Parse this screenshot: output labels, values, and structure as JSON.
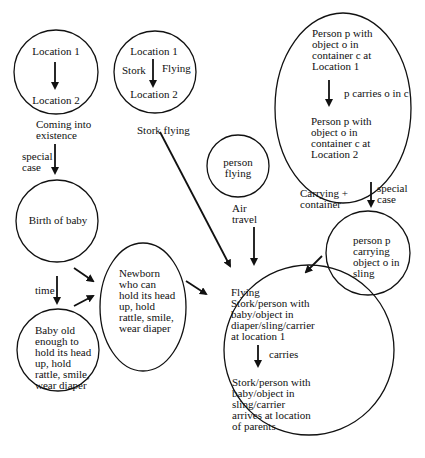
{
  "diagram": {
    "nodes": {
      "coming_into_existence": {
        "top": "Location 1",
        "bottom": "Location 2",
        "caption": "Coming into\nexistence"
      },
      "stork_flying": {
        "top": "Location 1",
        "left": "Stork",
        "right": "Flying",
        "bottom": "Location 2",
        "caption": "Stork flying"
      },
      "carrying_container": {
        "top": "Person p with\nobject o in\ncontainer c at\nLocation 1",
        "arrow_label": "p carries o in c",
        "bottom": "Person p with\nobject o in\ncontainer c at\nLocation 2",
        "caption": "Carrying +\ncontainer"
      },
      "person_flying": {
        "text": "person\nflying",
        "caption": "Air\ntravel"
      },
      "birth_of_baby": {
        "text": "Birth of baby"
      },
      "baby_old_enough": {
        "text": "Baby old\nenough to\nhold its head\nup, hold\nrattle, smile,\nwear diaper"
      },
      "newborn": {
        "text": "Newborn\nwho can\nhold its head\nup, hold\nrattle, smile,\nwear diaper"
      },
      "person_carrying_sling": {
        "text": "person p\ncarrying\nobject o in\nsling"
      },
      "flying_stork_blend": {
        "top": "Flying\nStork/person with\nbaby/object in\ndiaper/sling/carrier\nat location 1",
        "arrow_label": "carries",
        "bottom": "Stork/person with\nbaby/object in\nsling/carrier\narrives at location\nof parents"
      }
    },
    "edge_labels": {
      "special_case_left": "special\ncase",
      "time": "time",
      "special_case_right": "special\ncase"
    }
  }
}
